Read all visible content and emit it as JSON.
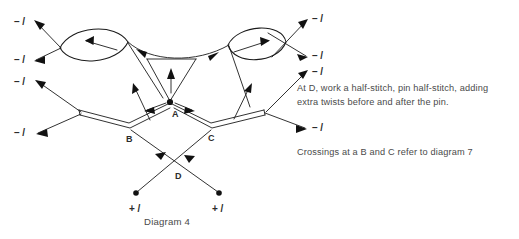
{
  "figure": {
    "caption": "Diagram 4",
    "background_color": "#ffffff",
    "ink_color": "#1b1b1b",
    "text_color": "#4a4a4a"
  },
  "notes": [
    {
      "id": "note-1",
      "text": "At D, work a half-stitch, pin half-stitch, adding"
    },
    {
      "id": "note-1b",
      "text": "extra twists before and after the pin."
    },
    {
      "id": "note-2",
      "text": "Crossings at a B and C refer to diagram 7"
    }
  ],
  "thread_end_labels": {
    "minus": "– /",
    "plus": "+ /"
  },
  "left_labels": [
    {
      "name": "minus-label-left-1",
      "text": "– /",
      "x": 14,
      "y": 22
    },
    {
      "name": "minus-label-left-2",
      "text": "– /",
      "x": 14,
      "y": 58
    },
    {
      "name": "minus-label-left-3",
      "text": "– /",
      "x": 14,
      "y": 80
    },
    {
      "name": "minus-label-left-4",
      "text": "– /",
      "x": 14,
      "y": 132
    }
  ],
  "right_labels": [
    {
      "name": "minus-label-right-1",
      "text": "– /",
      "x": 312,
      "y": 18
    },
    {
      "name": "minus-label-right-2",
      "text": "– /",
      "x": 312,
      "y": 53
    },
    {
      "name": "minus-label-right-3",
      "text": "– /",
      "x": 312,
      "y": 70
    },
    {
      "name": "minus-label-right-4",
      "text": "– /",
      "x": 312,
      "y": 126
    }
  ],
  "bottom_labels": [
    {
      "name": "plus-label-left",
      "text": "+ /",
      "x": 129,
      "y": 209
    },
    {
      "name": "plus-label-right",
      "text": "+ /",
      "x": 213,
      "y": 209
    }
  ],
  "nodes": [
    {
      "name": "node-a",
      "label": "A",
      "x": 170,
      "y": 102,
      "label_x": 172,
      "label_y": 117,
      "pin": true
    },
    {
      "name": "node-b",
      "label": "B",
      "x": 130,
      "y": 126,
      "label_x": 127,
      "label_y": 142,
      "pin": false
    },
    {
      "name": "node-c",
      "label": "C",
      "x": 211,
      "y": 126,
      "label_x": 209,
      "label_y": 141,
      "pin": false
    },
    {
      "name": "node-d",
      "label": "D",
      "x": 172,
      "y": 168,
      "label_x": 175,
      "label_y": 179,
      "pin": false
    },
    {
      "name": "pin-bottom-left",
      "label": "",
      "x": 136,
      "y": 193,
      "label_x": 0,
      "label_y": 0,
      "pin": true
    },
    {
      "name": "pin-bottom-right",
      "label": "",
      "x": 219,
      "y": 193,
      "label_x": 0,
      "label_y": 0,
      "pin": true
    }
  ],
  "loops": [
    {
      "name": "left-twist-loop",
      "cx": 94,
      "cy": 44,
      "direction": "left"
    },
    {
      "name": "right-twist-loop",
      "cx": 257,
      "cy": 43,
      "direction": "right"
    }
  ]
}
